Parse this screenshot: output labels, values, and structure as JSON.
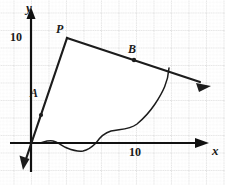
{
  "figure": {
    "background_color": "#ffffff",
    "grid": {
      "visible": true,
      "major_color": "#c9c9c9",
      "minor_color": "#e2e2e2",
      "major_spacing_px": 17.5,
      "minor_subdivisions": 5,
      "style": "dotted"
    },
    "axes": {
      "color": "#111111",
      "x_axis": {
        "name": "x",
        "arrow": true,
        "ticks": [
          {
            "label": "10",
            "value": 10
          }
        ]
      },
      "y_axis": {
        "name": "y",
        "arrow": true,
        "ticks": [
          {
            "label": "10",
            "value": 10
          }
        ]
      },
      "origin_px": {
        "x": 31,
        "y": 143
      }
    },
    "lines": [
      {
        "name": "A",
        "label": "A",
        "description": "steep ascending line through origin region with arrow at lower end and dot marker",
        "color": "#111111",
        "marker_dot": true,
        "arrow_end": "lower"
      },
      {
        "name": "B",
        "label": "B",
        "description": "gently descending line from point P toward the right with arrowhead at right end and dot marker at B",
        "color": "#111111",
        "marker_dot": true,
        "arrow_end": "right"
      }
    ],
    "points": [
      {
        "name": "P",
        "label": "P",
        "description": "intersection vertex of line A and line B at top of region",
        "px": {
          "x": 67,
          "y": 38
        }
      },
      {
        "name": "B",
        "label": "B",
        "description": "marked dot on line B",
        "px": {
          "x": 131,
          "y": 57
        }
      },
      {
        "name": "A",
        "label": "A",
        "description": "marked dot on line A",
        "px": {
          "x": 42,
          "y": 103
        }
      }
    ],
    "region": {
      "name": "bounded-region",
      "fill_color": "#ffffff",
      "outline_color": "#111111",
      "description": "white region bounded above-left by line A, above-right by line B, on the right by a curved boundary, and below by an irregular wavy line near the x-axis"
    }
  }
}
